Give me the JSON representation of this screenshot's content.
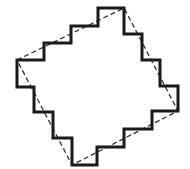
{
  "diagram": {
    "width": 190,
    "height": 169,
    "colors": {
      "background": "#ffffff",
      "staircase_stroke": "#1a1a1a",
      "square_stroke": "#333333"
    },
    "dashed_square": {
      "stroke_width": 1.3,
      "corners": [
        [
          17,
          60
        ],
        [
          124,
          8
        ],
        [
          178,
          111
        ],
        [
          72,
          165
        ]
      ]
    },
    "staircase": {
      "stroke_width": 3,
      "steps_per_side": 4,
      "points": [
        [
          17,
          60
        ],
        [
          44,
          60
        ],
        [
          44,
          43
        ],
        [
          71,
          43
        ],
        [
          71,
          26
        ],
        [
          98,
          26
        ],
        [
          98,
          8
        ],
        [
          124,
          8
        ],
        [
          124,
          34
        ],
        [
          142,
          34
        ],
        [
          142,
          60
        ],
        [
          160,
          60
        ],
        [
          160,
          86
        ],
        [
          178,
          86
        ],
        [
          178,
          111
        ],
        [
          152,
          111
        ],
        [
          152,
          129
        ],
        [
          124,
          129
        ],
        [
          124,
          147
        ],
        [
          97,
          147
        ],
        [
          97,
          165
        ],
        [
          72,
          165
        ],
        [
          72,
          138
        ],
        [
          53,
          138
        ],
        [
          53,
          112
        ],
        [
          34,
          112
        ],
        [
          34,
          87
        ],
        [
          17,
          87
        ]
      ]
    }
  }
}
